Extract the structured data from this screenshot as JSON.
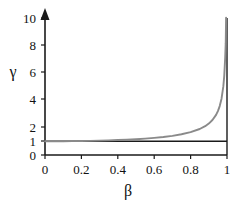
{
  "chart_data": {
    "type": "line",
    "title": "",
    "subtitle": "",
    "xlabel": "β",
    "ylabel": "γ",
    "xlim": [
      0,
      1
    ],
    "ylim": [
      0,
      10
    ],
    "grid": false,
    "legend": null,
    "legend_position": "none",
    "x_ticks": [
      {
        "value": 0,
        "label": "0"
      },
      {
        "value": 0.2,
        "label": "0.2"
      },
      {
        "value": 0.4,
        "label": "0.4"
      },
      {
        "value": 0.6,
        "label": "0.6"
      },
      {
        "value": 0.8,
        "label": "0.8"
      },
      {
        "value": 1,
        "label": "1"
      }
    ],
    "y_ticks": [
      {
        "value": 0,
        "label": "0"
      },
      {
        "value": 1,
        "label": "1"
      },
      {
        "value": 2,
        "label": "2"
      },
      {
        "value": 4,
        "label": "4"
      },
      {
        "value": 6,
        "label": "6"
      },
      {
        "value": 8,
        "label": "8"
      },
      {
        "value": 10,
        "label": "10"
      }
    ],
    "series": [
      {
        "name": "gamma",
        "color": "#8a8a8a",
        "x": [
          0,
          0.05,
          0.1,
          0.15,
          0.2,
          0.25,
          0.3,
          0.35,
          0.4,
          0.45,
          0.5,
          0.55,
          0.6,
          0.65,
          0.7,
          0.75,
          0.8,
          0.85,
          0.88,
          0.9,
          0.92,
          0.94,
          0.95,
          0.96,
          0.97,
          0.98,
          0.985,
          0.99,
          0.993,
          0.995
        ],
        "values": [
          1.0,
          1.001,
          1.005,
          1.011,
          1.021,
          1.033,
          1.048,
          1.068,
          1.091,
          1.12,
          1.155,
          1.198,
          1.25,
          1.316,
          1.4,
          1.512,
          1.667,
          1.898,
          2.105,
          2.294,
          2.552,
          2.931,
          3.203,
          3.571,
          4.113,
          5.025,
          5.793,
          7.089,
          8.164,
          10.013
        ]
      },
      {
        "name": "reference-line-gamma-1",
        "color": "#1a1a1a",
        "x": [
          0,
          1
        ],
        "values": [
          1,
          1
        ]
      }
    ],
    "annotations": [
      {
        "name": "y-axis-arrow",
        "text": ""
      }
    ],
    "colors": {
      "curve": "#8a8a8a",
      "axis": "#1a1a1a",
      "reference_line": "#1a1a1a",
      "background": "#ffffff"
    }
  }
}
